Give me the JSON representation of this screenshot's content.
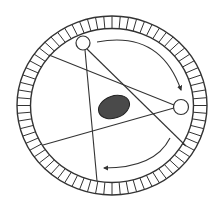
{
  "diagram": {
    "title": "",
    "colors": {
      "background": "#ffffff",
      "stroke": "#333333",
      "object_fill": "#4a4a4a"
    },
    "ring": {
      "cx": 112,
      "cy": 105.5,
      "outer_rx": 95,
      "outer_ry": 89.5,
      "inner_rx": 81.5,
      "inner_ry": 77,
      "segments": 72
    },
    "sources": [
      {
        "name": "source-top-left",
        "cx": 83,
        "cy": 43,
        "r": 7
      },
      {
        "name": "source-right",
        "cx": 181,
        "cy": 107,
        "r": 7.5
      }
    ],
    "beams": [
      {
        "name": "beam-left-to-right-source",
        "x1": 49,
        "y1": 55,
        "x2": 174,
        "y2": 105
      },
      {
        "name": "beam-right-source-to-lower-left",
        "x1": 174,
        "y1": 108,
        "x2": 43,
        "y2": 145
      },
      {
        "name": "beam-top-source-to-bottom",
        "x1": 85,
        "y1": 50,
        "x2": 97,
        "y2": 181
      },
      {
        "name": "beam-top-source-to-lower-right",
        "x1": 87,
        "y1": 49,
        "x2": 186,
        "y2": 146
      }
    ],
    "object": {
      "cx": 114,
      "cy": 107,
      "rx": 16,
      "ry": 11,
      "rotate": -20
    },
    "arrows": [
      {
        "name": "rotation-arrow-upper",
        "path": "M97,42 Q160,30 181,90"
      },
      {
        "name": "rotation-arrow-lower",
        "path": "M170,138 Q155,168 104,168"
      }
    ]
  }
}
